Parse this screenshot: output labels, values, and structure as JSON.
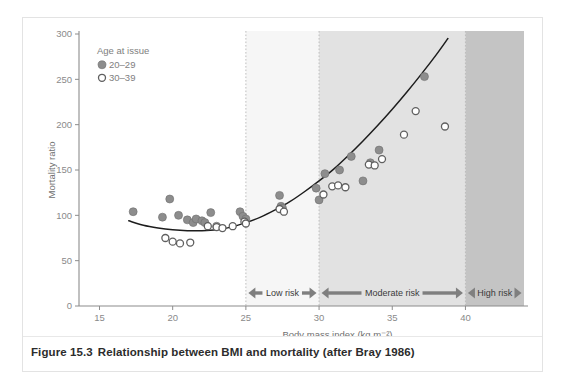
{
  "figure": {
    "caption_number": "Figure 15.3",
    "caption_text": "Relationship between BMI and mortality (after Bray 1986)"
  },
  "legend": {
    "title": "Age at issue",
    "entries": [
      {
        "label": "20–29",
        "marker": "filled-circle",
        "color": "#8d8d8d"
      },
      {
        "label": "30–39",
        "marker": "open-circle",
        "color": "#ffffff"
      }
    ]
  },
  "bands": [
    {
      "label": "Low risk",
      "from": 25,
      "to": 30,
      "fill": "#f6f6f6"
    },
    {
      "label": "Moderate risk",
      "from": 30,
      "to": 40,
      "fill": "#e2e2e2"
    },
    {
      "label": "High risk",
      "from": 40,
      "to": 44,
      "fill": "#c4c4c4"
    }
  ],
  "chart_data": {
    "type": "scatter",
    "title": "",
    "xlabel": "Body mass index (kg m⁻²)",
    "ylabel": "Mortality ratio",
    "xlim": [
      13.6,
      44
    ],
    "ylim": [
      0,
      300
    ],
    "xticks": [
      15,
      20,
      25,
      30,
      35,
      40
    ],
    "xticklabels": [
      "15",
      "20",
      "25",
      "30",
      "35",
      "40"
    ],
    "yticks": [
      0,
      50,
      100,
      150,
      200,
      250,
      300
    ],
    "yticklabels": [
      "0",
      "50",
      "100",
      "150",
      "200",
      "250",
      "300"
    ],
    "grid": false,
    "legend_position": "top-left",
    "series": [
      {
        "name": "20–29",
        "marker": "filled-circle",
        "points": [
          [
            17.3,
            104
          ],
          [
            19.3,
            98
          ],
          [
            19.8,
            118
          ],
          [
            20.4,
            100
          ],
          [
            21.0,
            95
          ],
          [
            21.4,
            92
          ],
          [
            21.6,
            96
          ],
          [
            22.0,
            94
          ],
          [
            22.2,
            92
          ],
          [
            22.6,
            103
          ],
          [
            23.0,
            88
          ],
          [
            24.6,
            104
          ],
          [
            24.8,
            99
          ],
          [
            25.0,
            96
          ],
          [
            27.3,
            122
          ],
          [
            27.4,
            110
          ],
          [
            27.5,
            108
          ],
          [
            29.8,
            130
          ],
          [
            30.0,
            117
          ],
          [
            30.4,
            146
          ],
          [
            31.4,
            150
          ],
          [
            32.2,
            165
          ],
          [
            33.0,
            138
          ],
          [
            33.5,
            158
          ],
          [
            34.1,
            172
          ],
          [
            37.2,
            253
          ]
        ]
      },
      {
        "name": "30–39",
        "marker": "open-circle",
        "points": [
          [
            19.5,
            75
          ],
          [
            20.0,
            71
          ],
          [
            20.5,
            69
          ],
          [
            21.2,
            70
          ],
          [
            22.4,
            88
          ],
          [
            23.0,
            87
          ],
          [
            23.4,
            86
          ],
          [
            24.1,
            88
          ],
          [
            24.9,
            93
          ],
          [
            25.0,
            91
          ],
          [
            27.3,
            107
          ],
          [
            27.6,
            104
          ],
          [
            30.3,
            123
          ],
          [
            30.9,
            132
          ],
          [
            31.3,
            133
          ],
          [
            31.8,
            131
          ],
          [
            33.4,
            156
          ],
          [
            33.8,
            155
          ],
          [
            34.3,
            162
          ],
          [
            35.8,
            189
          ],
          [
            36.6,
            215
          ],
          [
            38.6,
            198
          ]
        ]
      }
    ],
    "trend_curve": {
      "name": "fitted mortality curve",
      "points": [
        [
          17.0,
          94
        ],
        [
          18.0,
          89
        ],
        [
          19.0,
          86
        ],
        [
          20.0,
          84
        ],
        [
          21.0,
          83
        ],
        [
          22.0,
          83
        ],
        [
          23.0,
          84
        ],
        [
          24.0,
          87
        ],
        [
          25.0,
          92
        ],
        [
          26.0,
          98
        ],
        [
          27.0,
          106
        ],
        [
          28.0,
          115
        ],
        [
          29.0,
          126
        ],
        [
          30.0,
          138
        ],
        [
          31.0,
          151
        ],
        [
          32.0,
          166
        ],
        [
          33.0,
          182
        ],
        [
          34.0,
          199
        ],
        [
          35.0,
          217
        ],
        [
          36.0,
          236
        ],
        [
          37.0,
          256
        ],
        [
          38.0,
          277
        ],
        [
          38.8,
          295
        ]
      ]
    }
  }
}
